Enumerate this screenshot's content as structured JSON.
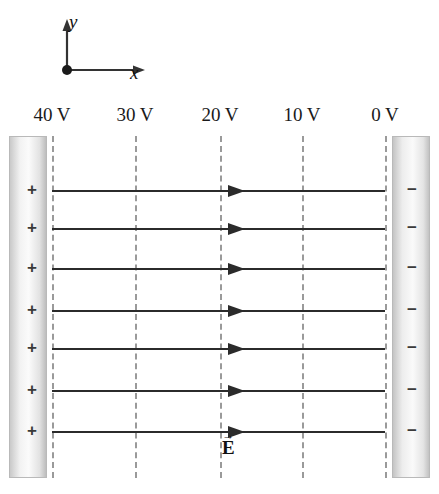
{
  "figure": {
    "width": 439,
    "height": 494,
    "background_color": "#ffffff"
  },
  "axes": {
    "x_label": "x",
    "y_label": "y",
    "origin": {
      "x": 67,
      "y": 70
    },
    "x_axis_end": 143,
    "y_axis_top": 22,
    "color": "#333333"
  },
  "equipotentials": [
    {
      "label": "40 V",
      "voltage": 40,
      "x": 52
    },
    {
      "label": "30 V",
      "voltage": 30,
      "x": 135
    },
    {
      "label": "20 V",
      "voltage": 20,
      "x": 220
    },
    {
      "label": "10 V",
      "voltage": 10,
      "x": 302
    },
    {
      "label": "0 V",
      "voltage": 0,
      "x": 385
    }
  ],
  "plates": {
    "left": {
      "name": "positive-plate",
      "charge_symbol": "+",
      "voltage": 40,
      "x": 9,
      "width": 38
    },
    "right": {
      "name": "negative-plate",
      "charge_symbol": "−",
      "voltage": 0,
      "x": 392,
      "width": 38
    }
  },
  "field_lines": {
    "count": 7,
    "y_positions": [
      190,
      228,
      268,
      310,
      348,
      390,
      431
    ],
    "start_x": 52,
    "end_x": 385,
    "arrow_x": 228,
    "color": "#2b2b2b",
    "direction": "left-to-right"
  },
  "field_label": {
    "symbol": "E",
    "arrow": "→",
    "meaning": "electric-field-vector"
  },
  "colors": {
    "line": "#2b2b2b",
    "dashed": "#9a9a9a",
    "text": "#1a1a1a",
    "plate_edge": "#b9b9b9"
  }
}
